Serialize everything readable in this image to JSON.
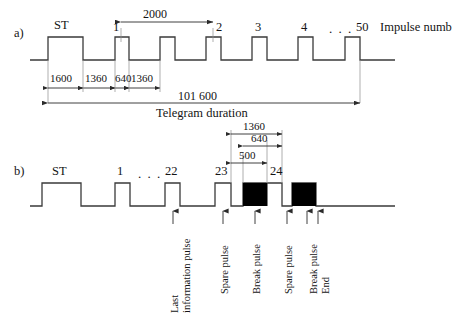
{
  "figure": {
    "panels": [
      {
        "tag": "a)",
        "caption": "Telegram duration",
        "right_label": "Impulse numb",
        "start_label": "ST",
        "ellipsis": ". . .",
        "impulse_numbers": [
          "1",
          "2",
          "3",
          "4",
          "50"
        ],
        "dimensions": {
          "pulse_period": "2000",
          "start_width": "1600",
          "gap_a": "1360",
          "pulse_width": "640",
          "gap_b": "1360",
          "telegram_duration": "101 600"
        }
      },
      {
        "tag": "b)",
        "start_label": "ST",
        "ellipsis": ". . .",
        "impulse_numbers": [
          "1",
          "22",
          "23",
          "24"
        ],
        "dimensions": {
          "outer": "1360",
          "middle": "640",
          "inner": "500"
        },
        "annotations": [
          {
            "text": "Last information pulse",
            "lines": [
              "Last",
              "information pulse"
            ]
          },
          {
            "text": "Spare pulse",
            "lines": [
              "Spare pulse"
            ]
          },
          {
            "text": "Break pulse",
            "lines": [
              "Break pulse"
            ]
          },
          {
            "text": "Spare pulse",
            "lines": [
              "Spare pulse"
            ]
          },
          {
            "text": "Break pulse End",
            "lines": [
              "Break pulse",
              "End"
            ]
          }
        ]
      }
    ]
  },
  "colors": {
    "line": "#3a3a3a",
    "fill": "#000000",
    "text": "#141414",
    "background": "#ffffff"
  }
}
